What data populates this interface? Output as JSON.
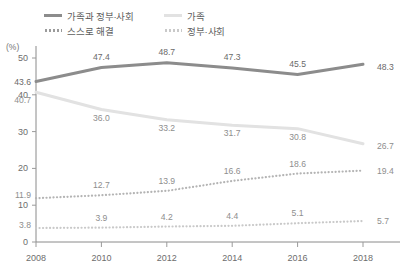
{
  "chart_data": {
    "type": "line",
    "title": "",
    "xlabel": "",
    "ylabel": "(%)",
    "ylim": [
      0,
      50
    ],
    "grid": false,
    "legend_position": "top-left",
    "categories": [
      "2008",
      "2010",
      "2012",
      "2014",
      "2016",
      "2018"
    ],
    "x": [
      2008,
      2010,
      2012,
      2014,
      2016,
      2018
    ],
    "yticks": [
      "0",
      "10",
      "20",
      "30",
      "40",
      "50"
    ],
    "series": [
      {
        "name": "가족과 정부·사회",
        "style": "solid",
        "color": "#8c8c8c",
        "values": [
          43.6,
          47.4,
          48.7,
          47.3,
          45.5,
          48.3
        ],
        "labels": [
          "43.6",
          "47.4",
          "48.7",
          "47.3",
          "45.5",
          "48.3"
        ]
      },
      {
        "name": "가족",
        "style": "solid",
        "color": "#e2e2e2",
        "values": [
          40.7,
          36.0,
          33.2,
          31.7,
          30.8,
          26.7
        ],
        "labels": [
          "40.7",
          "36.0",
          "33.2",
          "31.7",
          "30.8",
          "26.7"
        ]
      },
      {
        "name": "스스로 해결",
        "style": "dotted",
        "color": "#b4b4b4",
        "values": [
          11.9,
          12.7,
          13.9,
          16.6,
          18.6,
          19.4
        ],
        "labels": [
          "11.9",
          "12.7",
          "13.9",
          "16.6",
          "18.6",
          "19.4"
        ]
      },
      {
        "name": "정부·사회",
        "style": "dotted",
        "color": "#c9c9c9",
        "values": [
          3.8,
          3.9,
          4.2,
          4.4,
          5.1,
          5.7
        ],
        "labels": [
          "3.8",
          "3.9",
          "4.2",
          "4.4",
          "5.1",
          "5.7"
        ]
      }
    ]
  },
  "legend": {
    "items": [
      {
        "label": "가족과 정부·사회",
        "swatch": "solid-dark"
      },
      {
        "label": "가족",
        "swatch": "solid-light"
      },
      {
        "label": "스스로 해결",
        "swatch": "dot-dark"
      },
      {
        "label": "정부·사회",
        "swatch": "dot-light"
      }
    ]
  },
  "axis": {
    "unit": "(%)"
  }
}
